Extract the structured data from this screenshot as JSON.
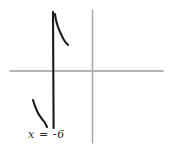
{
  "figure": {
    "title": "",
    "background_color": "#fefefe",
    "width": 169,
    "height": 149,
    "asymptote_label": "x = -6"
  },
  "chart_data": {
    "type": "line",
    "title": "",
    "subtitle": "",
    "xlabel": "",
    "ylabel": "",
    "style": "hand-drawn sketch",
    "grid": false,
    "legend": null,
    "axes": {
      "x_axis": {
        "orientation": "horizontal",
        "color": "#9a9a9a",
        "pixel_y": 71,
        "pixel_x_start": 10,
        "pixel_x_end": 163,
        "tick_labels": []
      },
      "y_axis": {
        "orientation": "vertical",
        "color": "#a8a8a8",
        "pixel_x": 92,
        "pixel_y_start": 10,
        "pixel_y_end": 143,
        "tick_labels": []
      }
    },
    "annotations": [
      {
        "name": "vertical-asymptote",
        "text": "x = -6",
        "value": -6,
        "color": "#1a1a1a",
        "pixel_x": 53,
        "pixel_y_start": 12,
        "pixel_y_end": 128,
        "label_pixel_x": 28,
        "label_pixel_y": 128
      }
    ],
    "series": [
      {
        "name": "upper-branch",
        "color": "#1a1a1a",
        "description": "branch right of the asymptote descending from top toward the right",
        "points": [
          [
            55,
            14
          ],
          [
            56,
            20
          ],
          [
            58,
            27
          ],
          [
            61,
            34
          ],
          [
            64,
            40
          ],
          [
            68,
            45
          ]
        ]
      },
      {
        "name": "lower-branch",
        "color": "#1a1a1a",
        "description": "branch left of the asymptote descending from upper left toward the asymptote",
        "points": [
          [
            33,
            100
          ],
          [
            35,
            106
          ],
          [
            38,
            113
          ],
          [
            42,
            119
          ],
          [
            45,
            123
          ],
          [
            47,
            127
          ]
        ]
      }
    ],
    "xlim": [
      10,
      163
    ],
    "ylim": [
      10,
      143
    ]
  }
}
